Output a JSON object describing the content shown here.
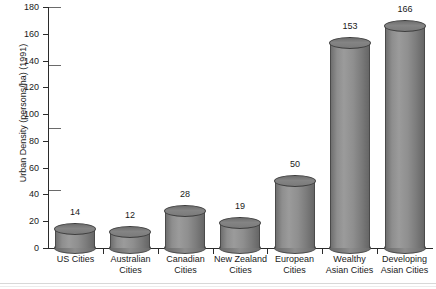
{
  "chart_data": {
    "type": "bar",
    "title": "",
    "xlabel": "",
    "ylabel": "Urban Density (persons/ha) (1991)",
    "ylim": [
      0,
      180
    ],
    "ytick_step": 20,
    "yticks": [
      0,
      20,
      40,
      60,
      80,
      100,
      120,
      140,
      160,
      180
    ],
    "grid": false,
    "legend": null,
    "bar_style": "3d-cylinder",
    "bar_color": "#8a8a8a",
    "bar_outline_color": "#4a4a4a",
    "axis_color": "#2b2b2b",
    "background": "#ffffff",
    "value_labels_shown": true,
    "categories": [
      "US Cities",
      "Australian Cities",
      "Canadian Cities",
      "New Zealand Cities",
      "European Cities",
      "Wealthy Asian Cities",
      "Developing Asian Cities"
    ],
    "category_lines": [
      [
        "US Cities"
      ],
      [
        "Australian",
        "Cities"
      ],
      [
        "Canadian",
        "Cities"
      ],
      [
        "New Zealand",
        "Cities"
      ],
      [
        "European",
        "Cities"
      ],
      [
        "Wealthy",
        "Asian Cities"
      ],
      [
        "Developing",
        "Asian Cities"
      ]
    ],
    "values": [
      14,
      12,
      28,
      19,
      50,
      153,
      166
    ]
  }
}
